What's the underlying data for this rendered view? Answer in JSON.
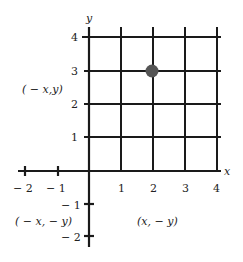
{
  "diagram": {
    "type": "coordinate-grid",
    "axes": {
      "x_label": "x",
      "y_label": "y",
      "x_ticks": [
        {
          "value": -2,
          "label": "− 2"
        },
        {
          "value": -1,
          "label": "− 1"
        },
        {
          "value": 1,
          "label": "1"
        },
        {
          "value": 2,
          "label": "2"
        },
        {
          "value": 3,
          "label": "3"
        },
        {
          "value": 4,
          "label": "4"
        }
      ],
      "y_ticks": [
        {
          "value": 4,
          "label": "4"
        },
        {
          "value": 3,
          "label": "3"
        },
        {
          "value": 2,
          "label": "2"
        },
        {
          "value": 1,
          "label": "1"
        },
        {
          "value": -1,
          "label": "− 1"
        },
        {
          "value": -2,
          "label": "− 2"
        }
      ]
    },
    "grid": {
      "x_range": [
        0,
        4
      ],
      "y_range": [
        0,
        4
      ],
      "step": 1
    },
    "point": {
      "x": 2,
      "y": 3,
      "color": "#555555"
    },
    "quadrant_labels": {
      "second": "( − x,y)",
      "third": "( − x, − y)",
      "fourth": "(x, − y)"
    },
    "colors": {
      "line": "#1a1a1a",
      "text": "#222222",
      "background": "#ffffff"
    }
  }
}
